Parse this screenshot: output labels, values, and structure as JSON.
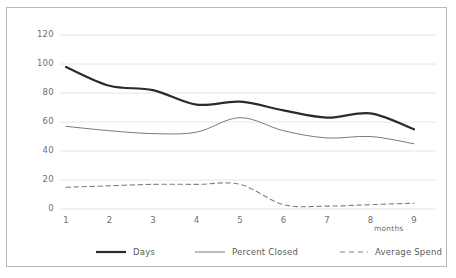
{
  "chart_data": {
    "type": "line",
    "title": "",
    "subtitle": "",
    "xlabel": "months",
    "ylabel": "",
    "xlim": [
      1,
      9
    ],
    "ylim": [
      0,
      120
    ],
    "grid": true,
    "grid_axis": "y",
    "legend_position": "bottom",
    "x": [
      1,
      2,
      3,
      4,
      5,
      6,
      7,
      8,
      9
    ],
    "xticklabels": [
      "1",
      "2",
      "3",
      "4",
      "5",
      "6",
      "7",
      "8",
      "9"
    ],
    "yticks": [
      0,
      20,
      40,
      60,
      80,
      100,
      120
    ],
    "yticklabels": [
      "0",
      "20",
      "40",
      "60",
      "80",
      "100",
      "120"
    ],
    "series": [
      {
        "name": "Days",
        "style": "solid-thick",
        "color": "#2b2b2b",
        "values": [
          98,
          85,
          82,
          72,
          74,
          68,
          63,
          66,
          55
        ]
      },
      {
        "name": "Percent Closed",
        "style": "solid-thin",
        "color": "#7a7a7a",
        "values": [
          57,
          54,
          52,
          53,
          63,
          54,
          49,
          50,
          45
        ]
      },
      {
        "name": "Average Spend",
        "style": "dashed",
        "color": "#808080",
        "values": [
          15,
          16,
          17,
          17,
          17,
          3,
          2,
          3,
          4
        ]
      }
    ]
  },
  "axes": {
    "y_labels": [
      "120",
      "100",
      "80",
      "60",
      "40",
      "20",
      "0"
    ],
    "x_labels": [
      "1",
      "2",
      "3",
      "4",
      "5",
      "6",
      "7",
      "8",
      "9"
    ],
    "x_axis_title": "months"
  },
  "legend": {
    "items": [
      {
        "label": "Days",
        "swatch": "thick-solid-line-icon"
      },
      {
        "label": "Percent Closed",
        "swatch": "thin-solid-line-icon"
      },
      {
        "label": "Average Spend",
        "swatch": "dashed-line-icon"
      }
    ]
  },
  "colors": {
    "frame_border": "#b8b8b8",
    "gridline": "#e6e6e6",
    "tick_text": "#6f6f6f",
    "legend_text": "#5a5a5a",
    "series_days": "#2b2b2b",
    "series_percent_closed": "#7a7a7a",
    "series_average_spend": "#808080",
    "background": "#ffffff"
  }
}
